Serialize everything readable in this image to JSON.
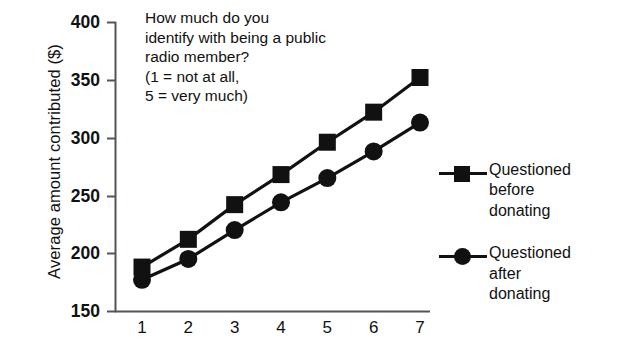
{
  "chart_data": {
    "type": "line",
    "title": "",
    "xlabel": "",
    "ylabel": "Average amount contributed ($)",
    "x": [
      1,
      2,
      3,
      4,
      5,
      6,
      7
    ],
    "xticklabels": [
      "1",
      "2",
      "3",
      "4",
      "5",
      "6",
      "7"
    ],
    "yticklabels": [
      "400",
      "350",
      "300",
      "250",
      "200",
      "150"
    ],
    "yticks": [
      400,
      350,
      300,
      250,
      200,
      150
    ],
    "ylim": [
      150,
      400
    ],
    "xlim": [
      0.6,
      7.4
    ],
    "grid": false,
    "legend_position": "right",
    "series": [
      {
        "name": "Questioned before donating",
        "marker": "square",
        "color": "#111111",
        "values": [
          188,
          212,
          242,
          268,
          296,
          322,
          352
        ]
      },
      {
        "name": "Questioned after donating",
        "marker": "circle",
        "color": "#111111",
        "values": [
          177,
          195,
          220,
          244,
          265,
          288,
          313
        ]
      }
    ],
    "annotation": [
      "How much do you",
      "identify with being a public",
      "radio member?",
      "(1 = not at all,",
      "5 = very much)"
    ]
  },
  "legend": {
    "items": [
      {
        "lines": [
          "Questioned",
          "before",
          "donating"
        ],
        "marker": "square-marker-icon"
      },
      {
        "lines": [
          "Questioned",
          "after",
          "donating"
        ],
        "marker": "circle-marker-icon"
      }
    ]
  }
}
